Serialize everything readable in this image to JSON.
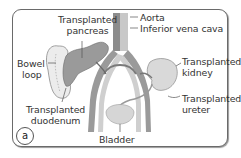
{
  "figure": {
    "panel_label": "a",
    "labels": {
      "transplanted_pancreas": [
        "Transplanted",
        "pancreas"
      ],
      "aorta": "Aorta",
      "inferior_vena_cava": "Inferior vena cava",
      "bowel_loop": [
        "Bowel",
        "loop"
      ],
      "transplanted_kidney": [
        "Transplanted",
        "kidney"
      ],
      "transplanted_duodenum": [
        "Transplanted",
        "duodenum"
      ],
      "transplanted_ureter": [
        "Transplanted",
        "ureter"
      ],
      "bladder": "Bladder"
    },
    "colors": {
      "frame": "#6a6a6a",
      "organ_fill": "#d9d9d9",
      "pancreas_fill": "#9a9a9a",
      "aorta": "#8c8c8c",
      "vena_cava": "#c4c4c4",
      "leader_line": "#555555"
    }
  }
}
